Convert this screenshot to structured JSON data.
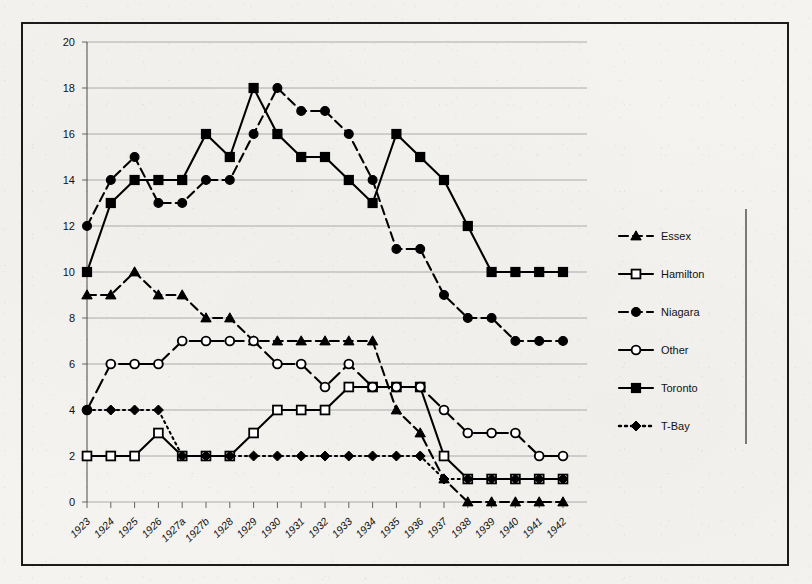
{
  "chart_data": {
    "type": "line",
    "title": "",
    "xlabel": "",
    "ylabel": "",
    "ylim": [
      0,
      20
    ],
    "ytick_step": 2,
    "grid": true,
    "legend_position": "right",
    "categories": [
      "1923",
      "1924",
      "1925",
      "1926",
      "1927a",
      "1927b",
      "1928",
      "1929",
      "1930",
      "1931",
      "1932",
      "1933",
      "1934",
      "1935",
      "1936",
      "1937",
      "1938",
      "1939",
      "1940",
      "1941",
      "1942"
    ],
    "ytick_labels": [
      "0",
      "2",
      "4",
      "6",
      "8",
      "10",
      "12",
      "14",
      "16",
      "18",
      "20"
    ],
    "series": [
      {
        "name": "Essex",
        "marker": "triangle-filled",
        "line_style": "dashed",
        "values": [
          9,
          9,
          10,
          9,
          9,
          8,
          8,
          7,
          7,
          7,
          7,
          7,
          7,
          4,
          3,
          1,
          0,
          0,
          0,
          0,
          0
        ]
      },
      {
        "name": "Hamilton",
        "marker": "square-open",
        "line_style": "solid",
        "values": [
          2,
          2,
          2,
          3,
          2,
          2,
          2,
          3,
          4,
          4,
          4,
          5,
          5,
          5,
          5,
          2,
          1,
          1,
          1,
          1,
          1
        ]
      },
      {
        "name": "Niagara",
        "marker": "circle-filled",
        "line_style": "dashed",
        "values": [
          12,
          14,
          15,
          13,
          13,
          14,
          14,
          16,
          18,
          17,
          17,
          16,
          14,
          11,
          11,
          9,
          8,
          8,
          7,
          7,
          7
        ]
      },
      {
        "name": "Other",
        "marker": "circle-open",
        "line_style": "solid-dash",
        "values": [
          4,
          6,
          6,
          6,
          7,
          7,
          7,
          7,
          6,
          6,
          5,
          6,
          5,
          5,
          5,
          4,
          3,
          3,
          3,
          2,
          2
        ]
      },
      {
        "name": "Toronto",
        "marker": "square-filled",
        "line_style": "solid",
        "values": [
          10,
          13,
          14,
          14,
          14,
          16,
          15,
          18,
          16,
          15,
          15,
          14,
          13,
          16,
          15,
          14,
          12,
          10,
          10,
          10,
          10
        ]
      },
      {
        "name": "T-Bay",
        "marker": "diamond-filled",
        "line_style": "dotted",
        "values": [
          4,
          4,
          4,
          4,
          2,
          2,
          2,
          2,
          2,
          2,
          2,
          2,
          2,
          2,
          2,
          1,
          1,
          1,
          1,
          1,
          1
        ]
      }
    ]
  },
  "legend": {
    "entries": [
      {
        "label": "Essex"
      },
      {
        "label": "Hamilton"
      },
      {
        "label": "Niagara"
      },
      {
        "label": "Other"
      },
      {
        "label": "Toronto"
      },
      {
        "label": "T-Bay"
      }
    ]
  },
  "colors": {
    "ink": "#000000",
    "grid": "#9a9a9a",
    "frame": "#1b1b1b",
    "paper": "#f4f3f0"
  }
}
